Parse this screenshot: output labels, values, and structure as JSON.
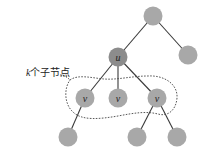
{
  "diagram": {
    "caption": {
      "variable": "k",
      "text": "个子节点"
    },
    "nodes": [
      {
        "id": "root",
        "label": ""
      },
      {
        "id": "right",
        "label": ""
      },
      {
        "id": "u",
        "label": "u"
      },
      {
        "id": "v1",
        "label": "v"
      },
      {
        "id": "v2",
        "label": "v"
      },
      {
        "id": "v3",
        "label": "v"
      },
      {
        "id": "leaf1",
        "label": ""
      },
      {
        "id": "leaf2",
        "label": ""
      },
      {
        "id": "leaf3",
        "label": ""
      }
    ],
    "edges": [
      [
        "root",
        "u"
      ],
      [
        "root",
        "right"
      ],
      [
        "u",
        "v1"
      ],
      [
        "u",
        "v2"
      ],
      [
        "u",
        "v3"
      ],
      [
        "v1",
        "leaf1"
      ],
      [
        "v3",
        "leaf2"
      ],
      [
        "v3",
        "leaf3"
      ]
    ],
    "colors": {
      "node_fill": "#a8a8a8",
      "u_fill": "#8c8c8c",
      "edge": "#3a3a3a"
    }
  }
}
